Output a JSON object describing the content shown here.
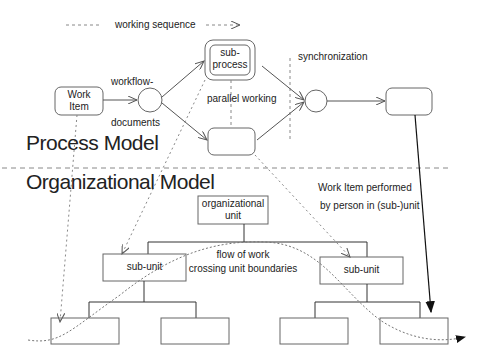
{
  "diagram": {
    "legend": {
      "working_sequence": "working sequence"
    },
    "process_model": {
      "title": "Process Model",
      "work_item": "Work\nItem",
      "workflow_label": "workflow-",
      "documents_label": "documents",
      "subprocess": "sub-\nprocess",
      "parallel_working": "parallel working",
      "synchronization": "synchronization"
    },
    "organizational_model": {
      "title": "Organizational Model",
      "org_unit": "organizational\nunit",
      "sub_unit_left": "sub-unit",
      "sub_unit_right": "sub-unit",
      "flow_of_work": "flow of work\ncrossing unit boundaries",
      "performed_1": "Work Item performed",
      "performed_2": "by person in (sub-)unit"
    }
  }
}
